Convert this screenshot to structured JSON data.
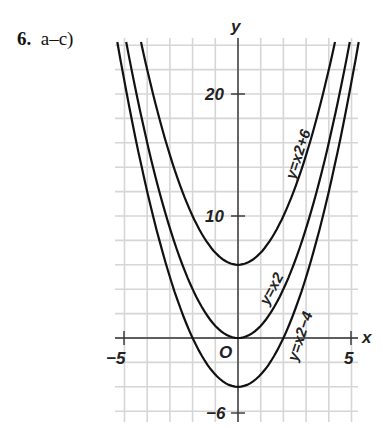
{
  "header": {
    "number": "6.",
    "parts": "a–c)"
  },
  "chart_data": {
    "type": "line",
    "title": "",
    "xlabel": "x",
    "ylabel": "y",
    "xlim": [
      -5.5,
      5.3
    ],
    "ylim": [
      -7,
      26
    ],
    "x_ticks": [
      "-5",
      "5"
    ],
    "y_ticks": [
      "20",
      "10",
      "-6"
    ],
    "origin_label": "O",
    "grid": true,
    "series": [
      {
        "name": "y=x2+6",
        "formula": "x^2+6",
        "vertex": [
          0,
          6
        ]
      },
      {
        "name": "y=x2",
        "formula": "x^2",
        "vertex": [
          0,
          0
        ]
      },
      {
        "name": "y=x2-4",
        "formula": "x^2-4",
        "vertex": [
          0,
          -4
        ]
      }
    ]
  },
  "labels": {
    "x_axis": "x",
    "y_axis": "y",
    "origin": "O",
    "tick_neg5": "−5",
    "tick_5": "5",
    "tick_20": "20",
    "tick_10": "10",
    "tick_neg6": "−6",
    "curve_a": "y=x2+6",
    "curve_b": "y=x2",
    "curve_c": "y=x2−4"
  }
}
